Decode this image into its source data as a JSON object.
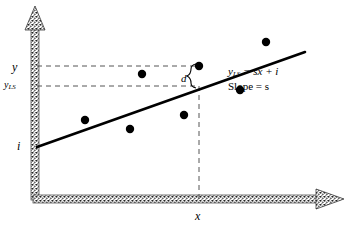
{
  "figure": {
    "type": "least-squares-regression-schematic",
    "background_color": "#ffffff",
    "ink_color": "#000000",
    "axes": {
      "x_axis_label": "x",
      "y_axis_label": "y",
      "style": "stippled-band-with-triangular-arrowhead",
      "x_arrow_direction": "right",
      "y_arrow_direction": "up"
    },
    "labels": {
      "y": "y",
      "y_ls_main": "y",
      "y_ls_sub": "LS",
      "intercept": "i",
      "x": "x",
      "residual": "d"
    },
    "equation": {
      "line1_main": "y",
      "line1_sub": "LS",
      "line1_rest": " = sx + i",
      "line2": "Slope = s"
    },
    "annotations": {
      "brace": "{",
      "brace_meaning": "residual-distance-bracket"
    }
  },
  "chart_data": {
    "type": "scatter",
    "title": "",
    "xlabel": "x",
    "ylabel": "y",
    "grid": false,
    "legend": "none",
    "points": [
      {
        "cx": 85,
        "cy": 120
      },
      {
        "cx": 130,
        "cy": 129
      },
      {
        "cx": 142,
        "cy": 74
      },
      {
        "cx": 184,
        "cy": 115
      },
      {
        "cx": 199,
        "cy": 66
      },
      {
        "cx": 240,
        "cy": 90
      },
      {
        "cx": 266,
        "cy": 42
      }
    ],
    "point_radius": 4.2,
    "fit_line": {
      "x1": 37,
      "y1": 147,
      "x2": 305,
      "y2": 52,
      "stroke_width": 2.6
    },
    "guides": {
      "horizontal_upper": {
        "x1": 37,
        "y1": 66,
        "x2": 199,
        "y2": 66
      },
      "horizontal_lower": {
        "x1": 37,
        "y1": 86,
        "x2": 199,
        "y2": 86
      },
      "vertical": {
        "x1": 199,
        "y1": 86,
        "x2": 199,
        "y2": 199
      },
      "dash_pattern": "5,4",
      "stroke_color": "#555555"
    },
    "highlight_point": {
      "cx": 199,
      "cy": 66
    },
    "fitted_point": {
      "cx": 199,
      "cy": 86
    },
    "residual_segment": {
      "from_y": 66,
      "to_y": 86,
      "label": "d"
    }
  }
}
